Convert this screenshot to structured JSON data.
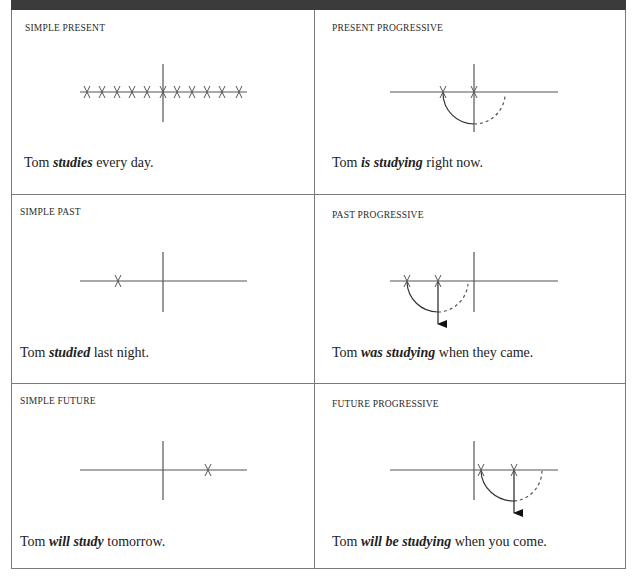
{
  "cells": [
    {
      "id": "simple-present",
      "title": "SIMPLE PRESENT",
      "sentence": {
        "before": "Tom ",
        "verb": "studies",
        "after": " every day."
      },
      "diagram": {
        "x_marks": 11,
        "present_marker": true,
        "progressive": false
      }
    },
    {
      "id": "present-progressive",
      "title": "PRESENT PROGRESSIVE",
      "sentence": {
        "before": "Tom ",
        "verb": "is studying",
        "after": " right now."
      },
      "diagram": {
        "x_marks": 2,
        "arc": "solid-then-dashed",
        "progressive": true
      }
    },
    {
      "id": "simple-past",
      "title": "SIMPLE PAST",
      "sentence": {
        "before": "Tom ",
        "verb": "studied",
        "after": " last night."
      },
      "diagram": {
        "x_marks": 1,
        "position": "past"
      }
    },
    {
      "id": "past-progressive",
      "title": "PAST PROGRESSIVE",
      "sentence": {
        "before": "Tom ",
        "verb": "was studying",
        "after": " when they came."
      },
      "diagram": {
        "x_marks": 2,
        "arc": "solid-then-dashed",
        "arrow": "down",
        "position": "past"
      }
    },
    {
      "id": "simple-future",
      "title": "SIMPLE FUTURE",
      "sentence": {
        "before": "Tom ",
        "verb": "will study",
        "after": " tomorrow."
      },
      "diagram": {
        "x_marks": 1,
        "position": "future"
      }
    },
    {
      "id": "future-progressive",
      "title": "FUTURE PROGRESSIVE",
      "sentence": {
        "before": "Tom ",
        "verb": "will be studying",
        "after": " when you come."
      },
      "diagram": {
        "x_marks": 2,
        "arc": "solid-then-dashed",
        "arrow": "down",
        "position": "future"
      }
    }
  ],
  "colors": {
    "border": "#7a7a7a",
    "topbar": "#3b3b3b",
    "line": "#555555",
    "text": "#222222"
  }
}
